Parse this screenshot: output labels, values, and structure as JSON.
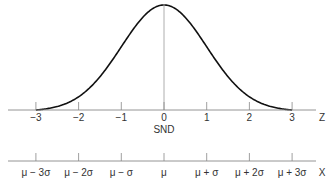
{
  "chart_data": {
    "type": "line",
    "title": "",
    "curve": "normal-pdf",
    "x": [
      -3,
      -2,
      -1,
      0,
      1,
      2,
      3
    ],
    "z_axis": {
      "label": "Z",
      "ticks": [
        "−3",
        "−2",
        "−1",
        "0",
        "1",
        "2",
        "3"
      ],
      "caption": "SND",
      "range": [
        -3,
        3
      ]
    },
    "x_axis": {
      "label": "X",
      "ticks": [
        "μ − 3σ",
        "μ − 2σ",
        "μ − σ",
        "μ",
        "μ + σ",
        "μ + 2σ",
        "μ + 3σ"
      ]
    },
    "center_line": {
      "at": 0
    },
    "grid": false,
    "legend": null
  },
  "colors": {
    "curve": "#111111",
    "axis": "#888888",
    "text": "#333333"
  }
}
